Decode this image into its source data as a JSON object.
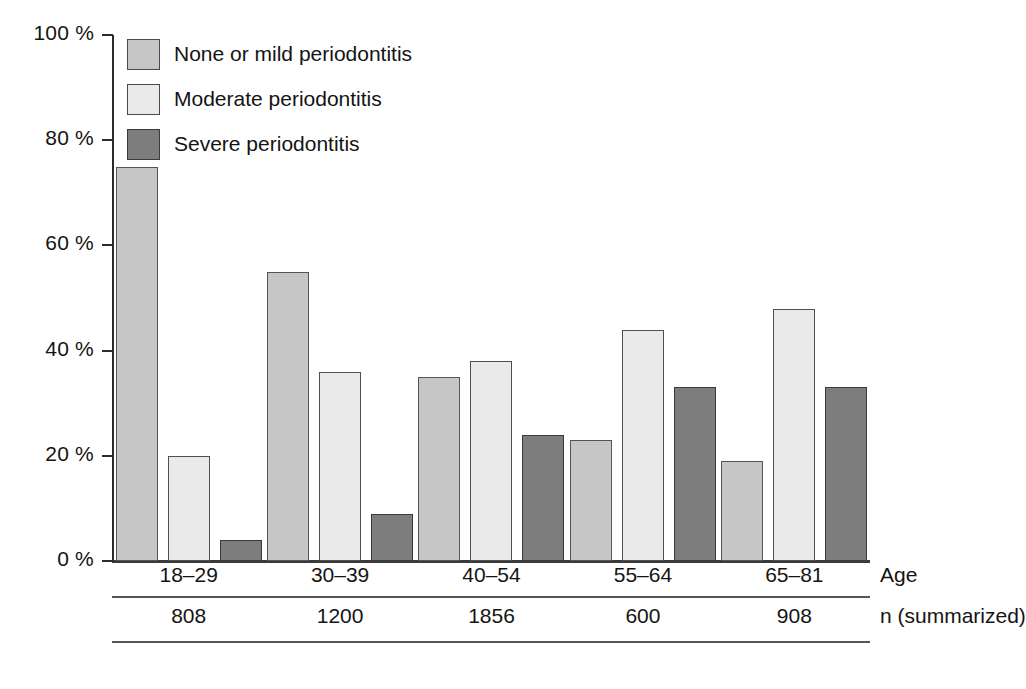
{
  "chart_data": {
    "type": "bar",
    "title": "",
    "xlabel": "Age",
    "ylabel": "",
    "ylim": [
      0,
      100
    ],
    "grid": false,
    "legend_position": "top-left",
    "categories": [
      "18–29",
      "30–39",
      "40–54",
      "55–64",
      "65–81"
    ],
    "series": [
      {
        "name": "None or mild periodontitis",
        "color": "#c6c6c6",
        "values": [
          75,
          55,
          35,
          23,
          19
        ]
      },
      {
        "name": "Moderate periodontitis",
        "color": "#eaeaea",
        "values": [
          20,
          36,
          38,
          44,
          48
        ]
      },
      {
        "name": "Severe periodontitis",
        "color": "#7d7d7d",
        "values": [
          4,
          9,
          24,
          33,
          33
        ]
      }
    ],
    "ytick_labels": [
      "100 %",
      "80 %",
      "60 %",
      "40 %",
      "20 %",
      "0 %"
    ],
    "ytick_values": [
      100,
      80,
      60,
      40,
      20,
      0
    ],
    "annotations": {
      "n_row_label": "n (summarized)",
      "n_values": [
        "808",
        "1200",
        "1856",
        "600",
        "908"
      ]
    }
  },
  "legend": {
    "items": [
      {
        "label": "None or mild periodontitis",
        "swatch": "s0"
      },
      {
        "label": "Moderate periodontitis",
        "swatch": "s1"
      },
      {
        "label": "Severe periodontitis",
        "swatch": "s2"
      }
    ]
  },
  "axis": {
    "y_ticks": [
      {
        "label": "100 %",
        "value": 100
      },
      {
        "label": "80 %",
        "value": 80
      },
      {
        "label": "60 %",
        "value": 60
      },
      {
        "label": "40 %",
        "value": 40
      },
      {
        "label": "20 %",
        "value": 20
      },
      {
        "label": "0 %",
        "value": 0
      }
    ]
  },
  "table": {
    "age_row_name": "Age",
    "age_cells": [
      "18–29",
      "30–39",
      "40–54",
      "55–64",
      "65–81"
    ],
    "n_row_name": "n (summarized)",
    "n_cells": [
      "808",
      "1200",
      "1856",
      "600",
      "908"
    ]
  }
}
